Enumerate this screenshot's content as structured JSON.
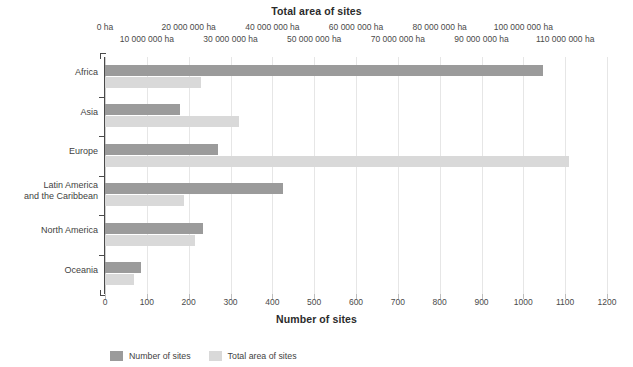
{
  "chart_data": {
    "type": "bar",
    "orientation": "horizontal",
    "title": "Total area of sites",
    "categories": [
      "Africa",
      "Asia",
      "Europe",
      "Latin America\nand the Caribbean",
      "North America",
      "Oceania"
    ],
    "series": [
      {
        "name": "Number of sites",
        "color": "#9b9b9b",
        "axis": "bottom",
        "values": [
          1048,
          180,
          270,
          425,
          235,
          85
        ]
      },
      {
        "name": "Total area of sites",
        "color": "#d9d9d9",
        "axis": "top",
        "unit": "ha",
        "values": [
          23000000,
          32000000,
          111000000,
          19000000,
          21500000,
          7000000
        ]
      }
    ],
    "bottom_axis": {
      "label": "Number of sites",
      "ticks": [
        0,
        100,
        200,
        300,
        400,
        500,
        600,
        700,
        800,
        900,
        1000,
        1100,
        1200
      ],
      "tick_labels": [
        "0",
        "100",
        "200",
        "300",
        "400",
        "500",
        "600",
        "700",
        "800",
        "900",
        "1000",
        "1100",
        "1200"
      ],
      "range": [
        0,
        1200
      ]
    },
    "top_axis": {
      "label": "Total area of sites",
      "tick_labels": [
        "0 ha",
        "10 000 000 ha",
        "20 000 000 ha",
        "30 000 000 ha",
        "40 000 000 ha",
        "50 000 000 ha",
        "60 000 000 ha",
        "70 000 000 ha",
        "80 000 000 ha",
        "90 000 000 ha",
        "100 000 000 ha",
        "110 000 000 ha"
      ],
      "ticks": [
        0,
        10000000,
        20000000,
        30000000,
        40000000,
        50000000,
        60000000,
        70000000,
        80000000,
        90000000,
        100000000,
        110000000
      ],
      "range": [
        0,
        120000000
      ]
    },
    "legend": {
      "position": "bottom-left",
      "entries": [
        {
          "label": "Number of sites",
          "color": "#9b9b9b"
        },
        {
          "label": "Total area of sites",
          "color": "#d9d9d9"
        }
      ]
    },
    "grid": {
      "vertical": true,
      "horizontal": false
    }
  }
}
